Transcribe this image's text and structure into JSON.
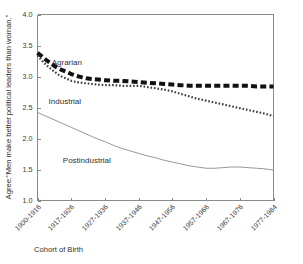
{
  "chart_data": {
    "type": "line",
    "title": "",
    "xlabel": "Cohort of Birth",
    "ylabel": "Agree:\"Men make better political leaders than woman.\"",
    "ylim": [
      1.0,
      4.0
    ],
    "yticks": [
      1.0,
      1.5,
      2.0,
      2.5,
      3.0,
      3.5,
      4.0
    ],
    "ytick_labels": [
      "1.0",
      "1.5",
      "2.0",
      "2.5",
      "3.0",
      "3.5",
      "4.0"
    ],
    "grid": false,
    "legend_position": "inline-annotations",
    "categories": [
      "1900-1916",
      "1917-1926",
      "1927-1936",
      "1937-1946",
      "1947-1956",
      "1957-1966",
      "1967-1976",
      "1977-1984"
    ],
    "x": [
      0,
      1,
      2,
      3,
      4,
      5,
      6,
      7
    ],
    "series": [
      {
        "name": "Agrarian",
        "style": "thick-dashed",
        "color": "#111111",
        "label_x": 0.42,
        "label_y": 3.18,
        "values": [
          3.38,
          3.12,
          2.98,
          2.93,
          2.89,
          2.85,
          2.85,
          2.84
        ],
        "dense_x": [
          0.0,
          0.12,
          0.25,
          0.38,
          0.5,
          0.62,
          0.75,
          0.88,
          1.0,
          1.15,
          1.3,
          1.45,
          1.6,
          1.8,
          2.0,
          2.25,
          2.5,
          2.75,
          3.0,
          3.25,
          3.5,
          3.75,
          4.0,
          4.25,
          4.5,
          4.75,
          5.0,
          5.25,
          5.5,
          5.75,
          6.0,
          6.25,
          6.5,
          6.75,
          7.0
        ],
        "dense_y": [
          3.38,
          3.33,
          3.27,
          3.22,
          3.17,
          3.13,
          3.1,
          3.07,
          3.04,
          3.01,
          2.99,
          2.97,
          2.96,
          2.95,
          2.94,
          2.93,
          2.93,
          2.92,
          2.91,
          2.9,
          2.89,
          2.88,
          2.87,
          2.86,
          2.85,
          2.85,
          2.85,
          2.85,
          2.85,
          2.85,
          2.85,
          2.85,
          2.84,
          2.84,
          2.84
        ]
      },
      {
        "name": "Industrial",
        "style": "fine-dotted",
        "color": "#3d3d3d",
        "label_x": 0.33,
        "label_y": 2.55,
        "values": [
          3.34,
          3.02,
          2.88,
          2.85,
          2.78,
          2.63,
          2.5,
          2.36
        ],
        "dense_x": [
          0.0,
          0.12,
          0.25,
          0.38,
          0.5,
          0.62,
          0.75,
          0.88,
          1.0,
          1.15,
          1.3,
          1.45,
          1.6,
          1.8,
          2.0,
          2.25,
          2.5,
          2.75,
          3.0,
          3.25,
          3.5,
          3.75,
          4.0,
          4.25,
          4.5,
          4.75,
          5.0,
          5.25,
          5.5,
          5.75,
          6.0,
          6.25,
          6.5,
          6.75,
          7.0
        ],
        "dense_y": [
          3.34,
          3.26,
          3.19,
          3.13,
          3.08,
          3.03,
          2.99,
          2.96,
          2.93,
          2.91,
          2.9,
          2.89,
          2.88,
          2.87,
          2.86,
          2.86,
          2.85,
          2.85,
          2.85,
          2.83,
          2.81,
          2.79,
          2.76,
          2.72,
          2.68,
          2.64,
          2.61,
          2.58,
          2.55,
          2.52,
          2.49,
          2.46,
          2.43,
          2.4,
          2.36
        ]
      },
      {
        "name": "Postindustrial",
        "style": "thin-solid",
        "color": "#8c8c8c",
        "label_x": 0.75,
        "label_y": 1.6,
        "values": [
          2.42,
          2.18,
          1.95,
          1.76,
          1.62,
          1.52,
          1.54,
          1.49
        ],
        "dense_x": [
          0.0,
          0.25,
          0.5,
          0.75,
          1.0,
          1.25,
          1.5,
          1.75,
          2.0,
          2.25,
          2.5,
          2.75,
          3.0,
          3.25,
          3.5,
          3.75,
          4.0,
          4.25,
          4.5,
          4.75,
          5.0,
          5.25,
          5.5,
          5.75,
          6.0,
          6.25,
          6.5,
          6.75,
          7.0
        ],
        "dense_y": [
          2.42,
          2.36,
          2.3,
          2.24,
          2.18,
          2.12,
          2.06,
          2.0,
          1.95,
          1.89,
          1.84,
          1.8,
          1.76,
          1.72,
          1.69,
          1.65,
          1.62,
          1.59,
          1.56,
          1.54,
          1.52,
          1.52,
          1.53,
          1.54,
          1.54,
          1.53,
          1.52,
          1.51,
          1.49
        ]
      }
    ]
  },
  "axes": {
    "frame_color": "#8a8a8a",
    "background": "#ffffff"
  }
}
